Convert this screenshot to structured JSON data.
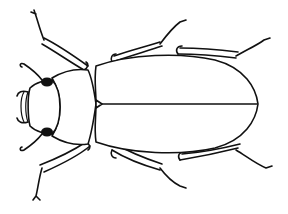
{
  "image": {
    "subject": "beetle line drawing",
    "view": "dorsal",
    "width": 288,
    "height": 214,
    "background": "#ffffff",
    "ink_color": "#111111"
  },
  "beetle": {
    "head": {
      "clypeus": "M24,92 C20,98 20,114 24,122",
      "clypeus_inner": "M28,92 C25,100 25,114 28,122",
      "outline": "M30,88 C36,82 46,80 52,80 C58,86 60,98 60,107 C60,116 58,128 52,134 C46,134 36,132 30,126 C28,118 27,98 30,88 Z",
      "eyes": [
        {
          "cx": 47,
          "cy": 82,
          "rx": 6,
          "ry": 4.5
        },
        {
          "cx": 47,
          "cy": 132,
          "rx": 6,
          "ry": 4.5
        }
      ],
      "antennae": [
        "M42,80 C36,72 30,68 24,64 C20,62 19,66 22,67",
        "M28,92 C22,90 18,92 17,96",
        "M28,122 C22,124 18,122 17,118",
        "M42,134 C36,142 30,146 24,150 C20,152 19,148 22,147"
      ]
    },
    "pronotum": {
      "outline": "M52,78 C62,72 74,68 88,70 C92,78 94,90 96,104 C94,118 92,132 88,144 C74,146 62,142 52,136 C58,126 60,116 60,107 C60,98 58,88 52,78 Z"
    },
    "scutellum": "M96,100 L102,104 L96,108 Z",
    "elytra": {
      "outline": "M96,66 C130,54 180,52 215,60 C245,68 256,88 258,104 C256,120 245,140 215,148 C180,156 130,154 96,142 C94,128 96,118 96,104 C96,90 94,80 96,66 Z",
      "suture": "M100,104 L257,104"
    },
    "legs": [
      {
        "name": "front-left",
        "femur": "M84,70 C70,62 56,52 42,44 M88,66 C74,56 60,46 44,38",
        "joint": "M84,70 C88,68 89,64 86,62",
        "tarsus": "M44,40 C40,30 38,22 36,16 L34,10 M36,14 L31,12"
      },
      {
        "name": "front-right",
        "femur": "M40,165 C58,158 74,150 86,142 M44,172 C62,164 78,156 90,146",
        "joint": "M86,142 C90,144 91,148 88,150",
        "tarsus": "M42,168 C39,178 38,188 36,196 L33,200 M36,196 L40,200"
      },
      {
        "name": "mid-left",
        "femur": "M112,62 C130,56 150,50 162,46 M114,56 C132,50 148,46 160,42",
        "joint": "M112,62 C110,58 112,54 116,54",
        "tarsus": "M160,44 C166,36 172,28 180,22 L186,20"
      },
      {
        "name": "mid-right",
        "femur": "M112,150 C128,160 146,166 160,170 M116,144 C132,154 150,160 162,164",
        "joint": "M112,150 C110,154 112,158 116,158",
        "tarsus": "M160,168 C166,176 172,182 180,186 L186,188"
      },
      {
        "name": "hind-left",
        "femur": "M178,54 C200,54 220,56 236,58 M180,48 C204,48 222,50 238,52",
        "joint": "M178,54 C175,50 177,46 182,46",
        "tarsus": "M236,56 C246,50 256,46 264,40 L270,38"
      },
      {
        "name": "hind-right",
        "femur": "M180,160 C204,156 222,152 238,148 M182,154 C206,152 224,148 240,144",
        "joint": "M180,160 C177,156 179,152 184,152",
        "tarsus": "M236,150 C246,156 256,164 266,168 L272,166"
      }
    ]
  },
  "caption": "Line drawing of a beetle, dorsal view"
}
